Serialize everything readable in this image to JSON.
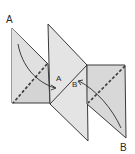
{
  "diagram": {
    "type": "folding-instruction",
    "labels": {
      "a_start": "A",
      "a_target": "A",
      "b_target": "B",
      "b_start": "B"
    },
    "colors": {
      "line": "#3a3a3a",
      "panel_fill": "#dcdcdc",
      "panel_fill_dark": "#c8c8c8",
      "background": "#ffffff"
    },
    "elements": [
      {
        "name": "left-panel",
        "shape": "triangle-pair",
        "fold_line": "dashed"
      },
      {
        "name": "middle-panel",
        "shape": "diamond",
        "fold_line": "solid"
      },
      {
        "name": "right-panel",
        "shape": "triangle-pair",
        "fold_line": "dashed"
      },
      {
        "name": "arrow-a",
        "from": "A (top-left corner)",
        "to": "A (center)"
      },
      {
        "name": "arrow-b",
        "from": "B (bottom-right corner)",
        "to": "B (center)"
      }
    ]
  }
}
